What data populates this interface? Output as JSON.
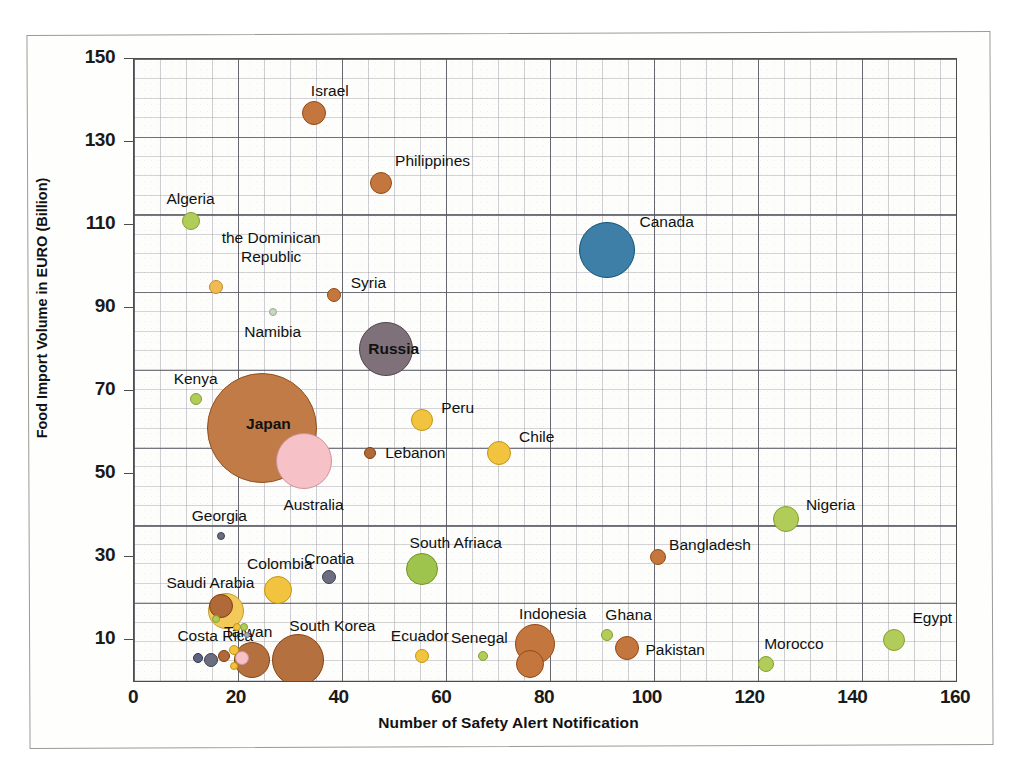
{
  "chart_data": {
    "type": "scatter",
    "title": "",
    "xlabel": "Number of Safety Alert Notification",
    "ylabel": "Food Import Volume in EURO (Billion)",
    "xlim": [
      0,
      160
    ],
    "ylim": [
      0,
      150
    ],
    "xticks": [
      0,
      20,
      40,
      60,
      80,
      100,
      120,
      140,
      160
    ],
    "yticks": [
      10,
      30,
      50,
      70,
      90,
      110,
      130,
      150
    ],
    "grid": true,
    "legend": "none",
    "bubble_meaning": "bubble area encodes a third magnitude",
    "points": [
      {
        "label": "Israel",
        "x": 35,
        "y": 137,
        "r": 12,
        "color": "#c4763f",
        "label_dx": 16,
        "label_dy": -22,
        "label_pos": "outside"
      },
      {
        "label": "Philippines",
        "x": 48,
        "y": 120,
        "r": 11,
        "color": "#c4763f",
        "label_dx": 52,
        "label_dy": -22,
        "label_pos": "outside"
      },
      {
        "label": "Algeria",
        "x": 11,
        "y": 111,
        "r": 9,
        "color": "#b2cc5a",
        "label_dx": 0,
        "label_dy": -22,
        "label_pos": "outside"
      },
      {
        "label": "Canada",
        "x": 92,
        "y": 104,
        "r": 28,
        "color": "#3d7fa6",
        "label_dx": 60,
        "label_dy": -28,
        "label_pos": "outside"
      },
      {
        "label": "the Dominican Republic",
        "x": 16,
        "y": 95,
        "r": 7,
        "color": "#f0bb55",
        "label_dx": 55,
        "label_dy": -40,
        "label_pos": "outside"
      },
      {
        "label": "Syria",
        "x": 39,
        "y": 93,
        "r": 7,
        "color": "#c4763f",
        "label_dx": 34,
        "label_dy": -12,
        "label_pos": "outside"
      },
      {
        "label": "Namibia",
        "x": 27,
        "y": 89,
        "r": 4,
        "color": "#c8d8c0",
        "label_dx": 0,
        "label_dy": 20,
        "label_pos": "outside"
      },
      {
        "label": "Russia",
        "x": 49,
        "y": 80,
        "r": 27,
        "color": "#7e7179",
        "label_dx": 8,
        "label_dy": 0,
        "label_pos": "inside"
      },
      {
        "label": "Kenya",
        "x": 12,
        "y": 68,
        "r": 6,
        "color": "#b2cc5a",
        "label_dx": 0,
        "label_dy": -20,
        "label_pos": "outside"
      },
      {
        "label": "Japan",
        "x": 25,
        "y": 61,
        "r": 55,
        "color": "#c07b47",
        "label_dx": 6,
        "label_dy": -4,
        "label_pos": "inside"
      },
      {
        "label": "Peru",
        "x": 56,
        "y": 63,
        "r": 11,
        "color": "#f2c33e",
        "label_dx": 36,
        "label_dy": -12,
        "label_pos": "outside"
      },
      {
        "label": "Australia",
        "x": 33,
        "y": 53,
        "r": 28,
        "color": "#f6c2c8",
        "label_dx": 10,
        "label_dy": 44,
        "label_pos": "outside"
      },
      {
        "label": "Lebanon",
        "x": 46,
        "y": 55,
        "r": 6,
        "color": "#b06a3a",
        "label_dx": 45,
        "label_dy": 0,
        "label_pos": "outside"
      },
      {
        "label": "Chile",
        "x": 71,
        "y": 55,
        "r": 12,
        "color": "#f2c33e",
        "label_dx": 38,
        "label_dy": -16,
        "label_pos": "outside"
      },
      {
        "label": "Nigeria",
        "x": 127,
        "y": 39,
        "r": 13,
        "color": "#b2cc5a",
        "label_dx": 44,
        "label_dy": -14,
        "label_pos": "outside"
      },
      {
        "label": "Georgia",
        "x": 17,
        "y": 35,
        "r": 4,
        "color": "#6b6e7f",
        "label_dx": -2,
        "label_dy": -20,
        "label_pos": "outside"
      },
      {
        "label": "Bangladesh",
        "x": 102,
        "y": 30,
        "r": 8,
        "color": "#c4763f",
        "label_dx": 52,
        "label_dy": -12,
        "label_pos": "outside"
      },
      {
        "label": "South Afriaca",
        "x": 56,
        "y": 27,
        "r": 16,
        "color": "#9ec44e",
        "label_dx": 34,
        "label_dy": -26,
        "label_pos": "outside"
      },
      {
        "label": "Croatia",
        "x": 38,
        "y": 25,
        "r": 7,
        "color": "#6b6e7f",
        "label_dx": 0,
        "label_dy": -18,
        "label_pos": "outside"
      },
      {
        "label": "Colombia",
        "x": 28,
        "y": 22,
        "r": 14,
        "color": "#f2c33e",
        "label_dx": 2,
        "label_dy": -26,
        "label_pos": "outside"
      },
      {
        "label": "Saudi Arabia",
        "x": 18,
        "y": 17,
        "r": 18,
        "color": "#f3c95a",
        "label_dx": -16,
        "label_dy": -28,
        "label_pos": "outside"
      },
      {
        "label": "Costa Rica",
        "x": 17,
        "y": 18,
        "r": 12,
        "color": "#b06a3a",
        "label_dx": -6,
        "label_dy": 30,
        "label_pos": "outside"
      },
      {
        "label": "Egypt",
        "x": 148,
        "y": 10,
        "r": 11,
        "color": "#b2cc5a",
        "label_dx": 38,
        "label_dy": -22,
        "label_pos": "outside"
      },
      {
        "label": "Ghana",
        "x": 92,
        "y": 11,
        "r": 6,
        "color": "#b2cc5a",
        "label_dx": 22,
        "label_dy": -20,
        "label_pos": "outside"
      },
      {
        "label": "Indonesia",
        "x": 78,
        "y": 9,
        "r": 20,
        "color": "#c4763f",
        "label_dx": 18,
        "label_dy": -30,
        "label_pos": "outside"
      },
      {
        "label": "Pakistan",
        "x": 96,
        "y": 8,
        "r": 12,
        "color": "#c4763f",
        "label_dx": 48,
        "label_dy": 2,
        "label_pos": "outside"
      },
      {
        "label": "South Korea",
        "x": 32,
        "y": 5,
        "r": 26,
        "color": "#b5703f",
        "label_dx": 34,
        "label_dy": -34,
        "label_pos": "outside"
      },
      {
        "label": "Taiwan",
        "x": 23,
        "y": 5,
        "r": 18,
        "color": "#b5703f",
        "label_dx": -4,
        "label_dy": -28,
        "label_pos": "outside"
      },
      {
        "label": "Ecuador",
        "x": 56,
        "y": 6,
        "r": 7,
        "color": "#f2c33e",
        "label_dx": -2,
        "label_dy": -20,
        "label_pos": "outside"
      },
      {
        "label": "Senegal",
        "x": 68,
        "y": 6,
        "r": 5,
        "color": "#b2cc5a",
        "label_dx": -4,
        "label_dy": -18,
        "label_pos": "outside"
      },
      {
        "label": "Hong Kong",
        "x": 77,
        "y": 4,
        "r": 14,
        "color": "#c4763f",
        "label_dx": 40,
        "label_dy": 22,
        "label_pos": "outside"
      },
      {
        "label": "Morocco",
        "x": 123,
        "y": 4,
        "r": 8,
        "color": "#b2cc5a",
        "label_dx": 28,
        "label_dy": -20,
        "label_pos": "outside"
      }
    ],
    "unlabeled_points": [
      {
        "x": 12.5,
        "y": 5.5,
        "r": 5,
        "color": "#5d6480"
      },
      {
        "x": 15,
        "y": 5,
        "r": 7,
        "color": "#6b6e7f"
      },
      {
        "x": 17.5,
        "y": 6,
        "r": 6,
        "color": "#b06a3a"
      },
      {
        "x": 19.5,
        "y": 7.5,
        "r": 5,
        "color": "#f2c33e"
      },
      {
        "x": 19.5,
        "y": 3.5,
        "r": 4,
        "color": "#f2c33e"
      },
      {
        "x": 21,
        "y": 5.5,
        "r": 7,
        "color": "#f6c2c8"
      },
      {
        "x": 20,
        "y": 13,
        "r": 4,
        "color": "#f2c33e"
      },
      {
        "x": 21.5,
        "y": 13,
        "r": 4,
        "color": "#b2cc5a"
      },
      {
        "x": 16,
        "y": 15,
        "r": 4,
        "color": "#b2cc5a"
      },
      {
        "x": 22,
        "y": 11,
        "r": 3,
        "color": "#aaaaaa"
      }
    ]
  }
}
